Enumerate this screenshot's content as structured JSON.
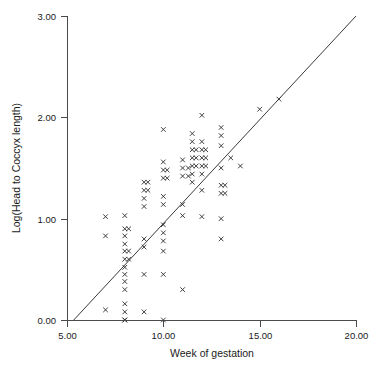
{
  "chart_data": {
    "type": "scatter",
    "title": "",
    "xlabel": "Week of gestation",
    "ylabel": "Log(Head to Coccyx length)",
    "xlim": [
      5.0,
      20.0
    ],
    "ylim": [
      0.0,
      3.0
    ],
    "grid": false,
    "legend": null,
    "marker": "x",
    "xticks": [
      "5.00",
      "10.00",
      "15.00",
      "20.00"
    ],
    "xtick_values": [
      5.0,
      10.0,
      15.0,
      20.0
    ],
    "yticks": [
      "0.00",
      "1.00",
      "2.00",
      "3.00"
    ],
    "ytick_values": [
      0.0,
      1.0,
      2.0,
      3.0
    ],
    "points": [
      [
        7.0,
        0.1
      ],
      [
        7.0,
        0.83
      ],
      [
        7.0,
        1.02
      ],
      [
        8.0,
        0.0
      ],
      [
        8.0,
        0.0
      ],
      [
        8.0,
        0.08
      ],
      [
        8.0,
        0.16
      ],
      [
        8.0,
        0.3
      ],
      [
        8.0,
        0.38
      ],
      [
        8.0,
        0.45
      ],
      [
        8.0,
        0.52
      ],
      [
        8.0,
        0.6
      ],
      [
        8.0,
        0.68
      ],
      [
        8.0,
        0.75
      ],
      [
        8.0,
        0.83
      ],
      [
        8.0,
        0.9
      ],
      [
        8.0,
        1.03
      ],
      [
        8.2,
        0.6
      ],
      [
        8.2,
        0.68
      ],
      [
        8.2,
        0.9
      ],
      [
        9.0,
        0.08
      ],
      [
        9.0,
        0.45
      ],
      [
        9.0,
        0.72
      ],
      [
        9.0,
        0.8
      ],
      [
        9.0,
        1.12
      ],
      [
        9.0,
        1.2
      ],
      [
        9.0,
        1.28
      ],
      [
        9.0,
        1.36
      ],
      [
        9.2,
        1.28
      ],
      [
        9.2,
        1.36
      ],
      [
        10.0,
        0.0
      ],
      [
        10.0,
        0.45
      ],
      [
        10.0,
        0.68
      ],
      [
        10.0,
        0.78
      ],
      [
        10.0,
        0.86
      ],
      [
        10.0,
        0.94
      ],
      [
        10.0,
        1.14
      ],
      [
        10.0,
        1.22
      ],
      [
        10.0,
        1.4
      ],
      [
        10.0,
        1.48
      ],
      [
        10.0,
        1.56
      ],
      [
        10.0,
        1.88
      ],
      [
        10.2,
        1.4
      ],
      [
        10.2,
        1.48
      ],
      [
        11.0,
        0.3
      ],
      [
        11.0,
        1.03
      ],
      [
        11.0,
        1.14
      ],
      [
        11.0,
        1.42
      ],
      [
        11.0,
        1.5
      ],
      [
        11.0,
        1.58
      ],
      [
        11.3,
        1.42
      ],
      [
        11.3,
        1.5
      ],
      [
        11.5,
        1.36
      ],
      [
        11.5,
        1.44
      ],
      [
        11.5,
        1.52
      ],
      [
        11.5,
        1.6
      ],
      [
        11.5,
        1.68
      ],
      [
        11.5,
        1.76
      ],
      [
        11.5,
        1.84
      ],
      [
        11.7,
        1.52
      ],
      [
        11.7,
        1.6
      ],
      [
        11.7,
        1.68
      ],
      [
        12.0,
        1.02
      ],
      [
        12.0,
        1.28
      ],
      [
        12.0,
        1.44
      ],
      [
        12.0,
        1.52
      ],
      [
        12.0,
        1.6
      ],
      [
        12.0,
        1.68
      ],
      [
        12.0,
        1.76
      ],
      [
        12.0,
        2.02
      ],
      [
        12.2,
        1.52
      ],
      [
        12.2,
        1.6
      ],
      [
        12.2,
        1.68
      ],
      [
        13.0,
        0.8
      ],
      [
        13.0,
        1.0
      ],
      [
        13.0,
        1.25
      ],
      [
        13.0,
        1.33
      ],
      [
        13.0,
        1.5
      ],
      [
        13.0,
        1.72
      ],
      [
        13.0,
        1.82
      ],
      [
        13.0,
        1.9
      ],
      [
        13.2,
        1.25
      ],
      [
        13.2,
        1.33
      ],
      [
        13.5,
        1.6
      ],
      [
        14.0,
        1.52
      ],
      [
        15.0,
        2.08
      ],
      [
        16.0,
        2.18
      ]
    ],
    "fit_line": {
      "label": "regression line",
      "x_start": 5.35,
      "y_start": 0.0,
      "x_end": 20.0,
      "y_end": 3.0
    }
  }
}
